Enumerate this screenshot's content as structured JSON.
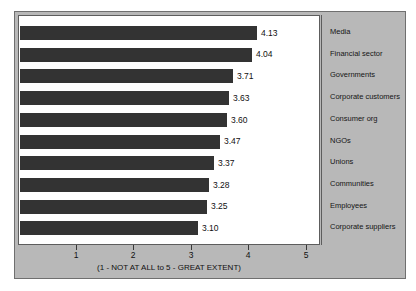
{
  "chart_data": {
    "type": "bar",
    "orientation": "horizontal",
    "title": "",
    "xlabel": "(1 - NOT AT ALL to 5 - GREAT EXTENT)",
    "ylabel": "",
    "xlim": [
      0,
      5
    ],
    "grid": false,
    "legend_position": "right",
    "xticks": [
      1,
      2,
      3,
      4,
      5
    ],
    "xtick_labels": [
      "1",
      "2",
      "3",
      "4",
      "5"
    ],
    "categories": [
      "Media",
      "Financial sector",
      "Governments",
      "Corporate customers",
      "Consumer org",
      "NGOs",
      "Unions",
      "Communities",
      "Employees",
      "Corporate suppliers"
    ],
    "values": [
      4.13,
      4.04,
      3.71,
      3.63,
      3.6,
      3.47,
      3.37,
      3.28,
      3.25,
      3.1
    ],
    "value_labels": [
      "4.13",
      "4.04",
      "3.71",
      "3.63",
      "3.60",
      "3.47",
      "3.37",
      "3.28",
      "3.25",
      "3.10"
    ],
    "bar_color": "#333333",
    "panel_color": "#b8b8b8",
    "plot_background": "#ffffff"
  },
  "axis": {
    "caption": "(1 - NOT AT ALL to 5 - GREAT EXTENT)",
    "ticks": [
      {
        "label": "1",
        "value": 1
      },
      {
        "label": "2",
        "value": 2
      },
      {
        "label": "3",
        "value": 3
      },
      {
        "label": "4",
        "value": 4
      },
      {
        "label": "5",
        "value": 5
      }
    ]
  },
  "legend": {
    "items": [
      {
        "label": "Media"
      },
      {
        "label": "Financial sector"
      },
      {
        "label": "Governments"
      },
      {
        "label": "Corporate customers"
      },
      {
        "label": "Consumer org"
      },
      {
        "label": "NGOs"
      },
      {
        "label": "Unions"
      },
      {
        "label": "Communities"
      },
      {
        "label": "Employees"
      },
      {
        "label": "Corporate suppliers"
      }
    ]
  }
}
